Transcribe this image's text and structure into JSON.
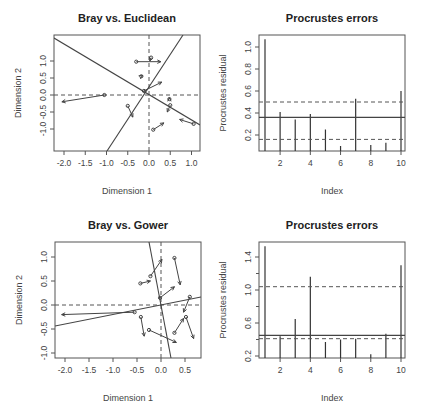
{
  "chart_data": [
    {
      "type": "scatter",
      "title": "Bray vs. Euclidean",
      "xlabel": "Dimension 1",
      "ylabel": "Dimension 2",
      "xticks": [
        "-2.0",
        "-1.5",
        "-1.0",
        "-0.5",
        "0.0",
        "0.5",
        "1.0"
      ],
      "yticks": [
        "-1.0",
        "-0.5",
        "0.0",
        "0.5",
        "1.0"
      ],
      "xlim": [
        -2.2,
        1.2
      ],
      "ylim": [
        -1.35,
        1.4
      ],
      "description": "Procrustes rotation plot: arrows from target to rotated configuration, rotated axes as solid lines",
      "arrows": [
        {
          "x0": -1.05,
          "y0": 0.0,
          "x1": -2.05,
          "y1": -0.2
        },
        {
          "x0": -0.3,
          "y0": 0.98,
          "x1": 0.28,
          "y1": 0.98
        },
        {
          "x0": 0.05,
          "y0": 1.1,
          "x1": 0.02,
          "y1": 1.0
        },
        {
          "x0": -0.18,
          "y0": 0.55,
          "x1": -0.15,
          "y1": 0.57
        },
        {
          "x0": -0.12,
          "y0": 0.12,
          "x1": 0.3,
          "y1": 0.38
        },
        {
          "x0": -0.5,
          "y0": -0.32,
          "x1": -0.38,
          "y1": -0.65
        },
        {
          "x0": 0.48,
          "y0": -0.12,
          "x1": 0.48,
          "y1": -0.08
        },
        {
          "x0": 0.5,
          "y0": -0.3,
          "x1": 0.43,
          "y1": -0.5
        },
        {
          "x0": 0.1,
          "y0": -1.02,
          "x1": 0.35,
          "y1": -0.82
        },
        {
          "x0": 1.05,
          "y0": -0.85,
          "x1": 0.72,
          "y1": -0.72
        }
      ]
    },
    {
      "type": "bar",
      "title": "Procrustes errors",
      "xlabel": "Index",
      "ylabel": "Procrustes residual",
      "xticks": [
        "2",
        "4",
        "6",
        "8",
        "10"
      ],
      "yticks": [
        "0.2",
        "0.4",
        "0.6",
        "0.8",
        "1.0"
      ],
      "categories": [
        1,
        2,
        3,
        4,
        5,
        6,
        7,
        8,
        9,
        10
      ],
      "values": [
        1.07,
        0.41,
        0.34,
        0.39,
        0.25,
        0.1,
        0.53,
        0.11,
        0.13,
        0.6
      ],
      "ylim": [
        0.05,
        1.1
      ],
      "hlines": {
        "median_solid": 0.36,
        "quartiles_dashed": [
          0.16,
          0.5
        ]
      }
    },
    {
      "type": "scatter",
      "title": "Bray vs. Gower",
      "xlabel": "Dimension 1",
      "ylabel": "Dimension 2",
      "xticks": [
        "-2.0",
        "-1.5",
        "-1.0",
        "-0.5",
        "0.0",
        "0.5"
      ],
      "yticks": [
        "-1.0",
        "-0.5",
        "0.0",
        "0.5",
        "1.0"
      ],
      "xlim": [
        -2.2,
        0.8
      ],
      "ylim": [
        -1.1,
        1.3
      ],
      "arrows": [
        {
          "x0": -0.55,
          "y0": -0.15,
          "x1": -2.07,
          "y1": -0.2
        },
        {
          "x0": -0.42,
          "y0": -0.25,
          "x1": -0.35,
          "y1": -0.65
        },
        {
          "x0": -0.25,
          "y0": -0.52,
          "x1": 0.32,
          "y1": -0.78
        },
        {
          "x0": -0.43,
          "y0": 0.45,
          "x1": -0.22,
          "y1": 0.5
        },
        {
          "x0": -0.22,
          "y0": 0.6,
          "x1": 0.02,
          "y1": 0.95
        },
        {
          "x0": -0.02,
          "y0": 0.15,
          "x1": 0.28,
          "y1": 0.38
        },
        {
          "x0": 0.28,
          "y0": 0.98,
          "x1": 0.4,
          "y1": 0.42
        },
        {
          "x0": 0.28,
          "y0": -0.58,
          "x1": 0.47,
          "y1": -0.28
        },
        {
          "x0": 0.6,
          "y0": 0.17,
          "x1": 0.47,
          "y1": -0.15
        },
        {
          "x0": 0.52,
          "y0": -0.25,
          "x1": 0.68,
          "y1": -0.7
        }
      ]
    },
    {
      "type": "bar",
      "title": "Procrustes errors",
      "xlabel": "Index",
      "ylabel": "Procrustes residual",
      "xticks": [
        "2",
        "4",
        "6",
        "8",
        "10"
      ],
      "yticks": [
        "0.2",
        "0.6",
        "1.0",
        "1.4"
      ],
      "categories": [
        1,
        2,
        3,
        4,
        5,
        6,
        7,
        8,
        9,
        10
      ],
      "values": [
        1.53,
        0.44,
        0.65,
        1.16,
        0.37,
        0.4,
        0.41,
        0.22,
        0.47,
        1.3
      ],
      "ylim": [
        0.15,
        1.6
      ],
      "hlines": {
        "median_solid": 0.45,
        "quartiles_dashed": [
          0.41,
          1.04
        ]
      }
    }
  ]
}
